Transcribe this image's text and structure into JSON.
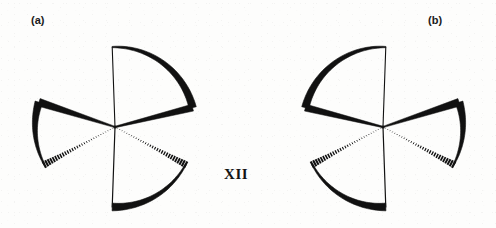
{
  "figure": {
    "compound_label": "XII",
    "background_color": "#fdfdfc",
    "ink_color": "#111111",
    "panels": [
      {
        "id": "a",
        "label": "(a)",
        "label_x": 31,
        "label_y": 14,
        "center_x": 115,
        "center_y": 127,
        "mirror": 1,
        "description": "three-bladed propeller, clockwise twist",
        "blades": [
          {
            "name": "upper-right-blade",
            "edge_thin_angle_deg": -91,
            "edge_thick_angle_deg": -16,
            "radius": 80,
            "arc_style": "bold-tapered",
            "near_edge_style": "thin-line",
            "far_edge_style": "wedge-solid"
          },
          {
            "name": "left-blade",
            "edge_thick_angle_deg": 197,
            "edge_hatched_angle_deg": 153,
            "radius": 80,
            "arc_style": "bold-tapered",
            "near_edge_style": "wedge-solid",
            "far_edge_style": "hashed"
          },
          {
            "name": "lower-right-blade",
            "edge_thin_angle_deg": 89,
            "edge_hatched_angle_deg": 27,
            "radius": 80,
            "arc_style": "bold-tapered",
            "near_edge_style": "thin-line",
            "far_edge_style": "hashed"
          }
        ]
      },
      {
        "id": "b",
        "label": "(b)",
        "label_x": 428,
        "label_y": 14,
        "center_x": 383,
        "center_y": 127,
        "mirror": -1,
        "description": "three-bladed propeller, counter-clockwise twist (enantiomer of a)",
        "blades": [
          {
            "name": "upper-left-blade",
            "edge_thin_angle_deg": -91,
            "edge_thick_angle_deg": -16,
            "radius": 80,
            "arc_style": "bold-tapered",
            "near_edge_style": "thin-line",
            "far_edge_style": "wedge-solid"
          },
          {
            "name": "right-blade",
            "edge_thick_angle_deg": 197,
            "edge_hatched_angle_deg": 153,
            "radius": 80,
            "arc_style": "bold-tapered",
            "near_edge_style": "wedge-solid",
            "far_edge_style": "hashed"
          },
          {
            "name": "lower-left-blade",
            "edge_thin_angle_deg": 89,
            "edge_hatched_angle_deg": 27,
            "radius": 80,
            "arc_style": "bold-tapered",
            "near_edge_style": "thin-line",
            "far_edge_style": "hashed"
          }
        ]
      }
    ]
  }
}
